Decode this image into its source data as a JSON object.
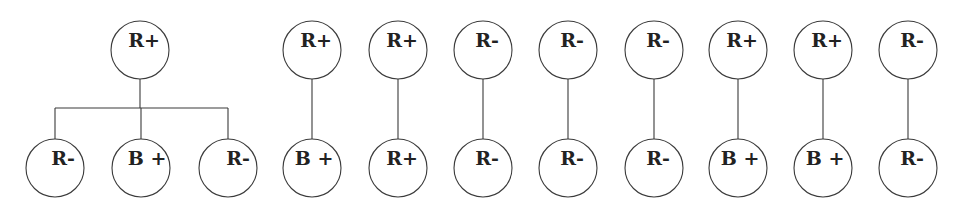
{
  "diagram": {
    "type": "tree-diagram",
    "node_radius": 29,
    "colors": {
      "stroke": "#3a3a3a",
      "text": "#222222",
      "background": "#ffffff"
    },
    "tree": {
      "root": {
        "label": "R+",
        "x": 140,
        "y": 50
      },
      "bar_y": 108,
      "children": [
        {
          "label": "R-",
          "x": 55,
          "y": 168,
          "label_dx": 2
        },
        {
          "label": "B +",
          "x": 141,
          "y": 168,
          "label_dx": 0
        },
        {
          "label": "R-",
          "x": 228,
          "y": 168,
          "label_dx": 4
        }
      ]
    },
    "pairs": [
      {
        "top": "R+",
        "bottom": "B +",
        "x": 312
      },
      {
        "top": "R+",
        "bottom": "R+",
        "x": 398
      },
      {
        "top": "R-",
        "bottom": "R-",
        "x": 483
      },
      {
        "top": "R-",
        "bottom": "R-",
        "x": 568
      },
      {
        "top": "R-",
        "bottom": "R-",
        "x": 654
      },
      {
        "top": "R+",
        "bottom": "B +",
        "x": 738
      },
      {
        "top": "R+",
        "bottom": "B +",
        "x": 823
      },
      {
        "top": "R-",
        "bottom": "R-",
        "x": 908
      }
    ],
    "pair_top_y": 50,
    "pair_bottom_y": 168
  }
}
